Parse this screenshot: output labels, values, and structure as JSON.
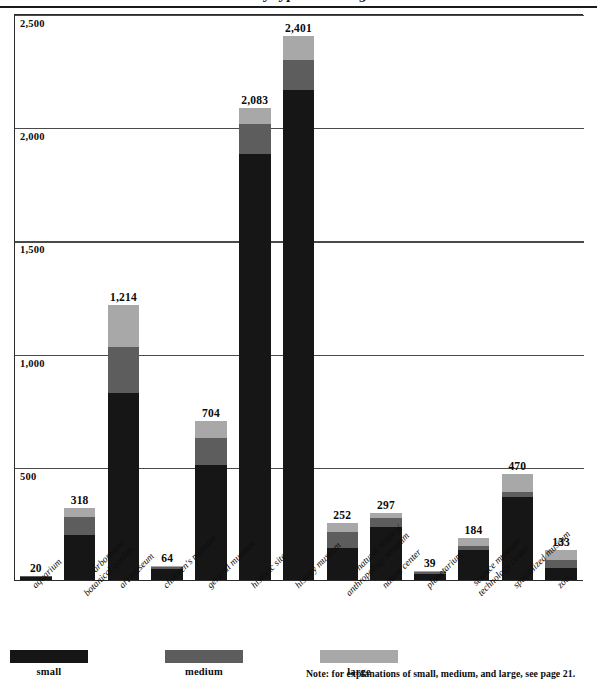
{
  "figure": {
    "title": "Museums by type and budget size",
    "note": "Note: for explanations of small, medium, and large, see page 21."
  },
  "legend": {
    "position": "bottom-left",
    "items": [
      {
        "label": "small",
        "color": "#161616"
      },
      {
        "label": "medium",
        "color": "#5d5d5d"
      },
      {
        "label": "large",
        "color": "#a8a8a8"
      }
    ]
  },
  "axis": {
    "yticks": [
      "2,500",
      "2,000",
      "1,500",
      "1,000",
      "500"
    ],
    "ytick_values": [
      2500,
      2000,
      1500,
      1000,
      500
    ]
  },
  "chart_data": {
    "type": "bar",
    "stacked": true,
    "title": "Museums by type and budget size",
    "xlabel": "",
    "ylabel": "",
    "ylim": [
      0,
      2500
    ],
    "grid": true,
    "legend_position": "bottom-left",
    "categories": [
      "aquarium",
      "arboretum/ botanical garden",
      "art museum",
      "children's museum",
      "general museum",
      "historic site",
      "history museum",
      "natural history/ anthropology museum",
      "nature center",
      "planetarium",
      "science museum/ technology center",
      "specialized museum",
      "zoo"
    ],
    "totals": [
      20,
      318,
      1214,
      64,
      704,
      2083,
      2401,
      252,
      297,
      39,
      184,
      470,
      133
    ],
    "total_labels": [
      "20",
      "318",
      "1,214",
      "64",
      "704",
      "2,083",
      "2,401",
      "252",
      "297",
      "39",
      "184",
      "470",
      "133"
    ],
    "series": [
      {
        "name": "small",
        "color": "#161616",
        "values": [
          16,
          198,
          826,
          50,
          507,
          1884,
          2163,
          141,
          234,
          31,
          132,
          366,
          53
        ]
      },
      {
        "name": "medium",
        "color": "#5d5d5d",
        "values": [
          3,
          80,
          203,
          10,
          119,
          132,
          132,
          71,
          40,
          6,
          18,
          22,
          35
        ]
      },
      {
        "name": "large",
        "color": "#a8a8a8",
        "values": [
          1,
          40,
          185,
          4,
          78,
          67,
          106,
          40,
          23,
          2,
          34,
          82,
          45
        ]
      }
    ]
  },
  "bar_labels": {
    "aquarium": "20",
    "arboretum": "318",
    "art_museum": "1,214",
    "childrens_museum": "64",
    "general_museum": "704",
    "historic_site": "2,083",
    "history_museum": "2,401",
    "natural_history": "252",
    "nature_center": "297",
    "planetarium": "39",
    "science_museum": "184",
    "specialized_museum": "470",
    "zoo": "133"
  }
}
